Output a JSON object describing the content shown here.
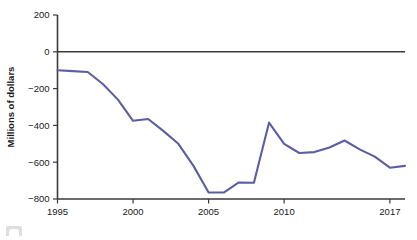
{
  "chart_data": {
    "type": "line",
    "title": "",
    "subtitle": "",
    "xlabel": "",
    "ylabel": "Millions of dollars",
    "xlim": [
      1995,
      2018
    ],
    "ylim": [
      -800,
      200
    ],
    "grid": false,
    "legend": null,
    "y_ticks": [
      200,
      0,
      -200,
      -400,
      -600,
      -800
    ],
    "y_tick_labels": [
      "200",
      "0",
      "−200",
      "−400",
      "−600",
      "−800"
    ],
    "x_ticks": [
      1995,
      2000,
      2005,
      2010,
      2017
    ],
    "x_tick_labels": [
      "1995",
      "2000",
      "2005",
      "2010",
      "2017"
    ],
    "zero_line": 0,
    "series": [
      {
        "name": "Net balance",
        "color": "#5b5ea6",
        "x": [
          1995,
          1996,
          1997,
          1998,
          1999,
          2000,
          2001,
          2002,
          2003,
          2004,
          2005,
          2006,
          2007,
          2008,
          2009,
          2010,
          2011,
          2012,
          2013,
          2014,
          2015,
          2016,
          2017,
          2018
        ],
        "values": [
          -100,
          -105,
          -110,
          -175,
          -260,
          -375,
          -365,
          -430,
          -500,
          -620,
          -765,
          -765,
          -710,
          -712,
          -385,
          -500,
          -550,
          -545,
          -520,
          -482,
          -530,
          -570,
          -630,
          -620
        ]
      }
    ]
  },
  "axis": {
    "y_title": "Millions of dollars"
  }
}
